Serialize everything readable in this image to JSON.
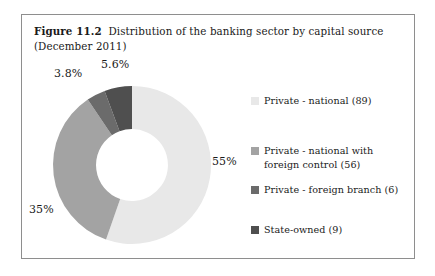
{
  "figure": {
    "label": "Figure 11.2",
    "caption": "Distribution of the banking sector by capital source (December 2011)",
    "border_color": "#8e8e8e",
    "background": "#ffffff"
  },
  "chart_data": {
    "type": "pie",
    "variant": "donut",
    "title": "Distribution of the banking sector by capital source (December 2011)",
    "xlabel": "",
    "ylabel": "",
    "start_angle_deg": 0,
    "direction": "clockwise",
    "inner_radius_ratio": 0.455,
    "legend_position": "right",
    "grid": false,
    "categories": [
      "Private - national (89)",
      "Private - national with foreign control (56)",
      "Private - foreign branch (6)",
      "State-owned (9)"
    ],
    "values": [
      55,
      35,
      3.8,
      5.6
    ],
    "counts": [
      89,
      56,
      6,
      9
    ],
    "data_labels": [
      "55%",
      "35%",
      "3.8%",
      "5.6%"
    ],
    "colors": [
      "#e8e8e8",
      "#a3a3a3",
      "#6b6b6b",
      "#4f4f4f"
    ]
  },
  "legend": {
    "items": [
      {
        "label_line1": "Private - national (89)",
        "label_line2": "",
        "color": "#e8e8e8"
      },
      {
        "label_line1": "Private - national with",
        "label_line2": "foreign control (56)",
        "color": "#a3a3a3"
      },
      {
        "label_line1": "Private - foreign branch (6)",
        "label_line2": "",
        "color": "#6b6b6b"
      },
      {
        "label_line1": "State-owned (9)",
        "label_line2": "",
        "color": "#4f4f4f"
      }
    ]
  }
}
